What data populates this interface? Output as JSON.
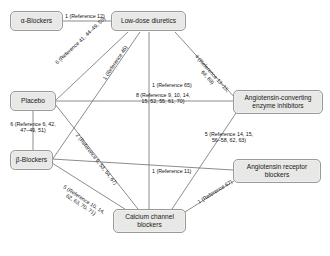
{
  "diagram": {
    "type": "network-meta-analysis",
    "node_fill": "#e8e8e6",
    "node_stroke": "#9a9a98",
    "edge_stroke": "#6f6f6f",
    "background": "#ffffff"
  },
  "nodes": [
    {
      "id": "alpha",
      "label": "α-Blockers"
    },
    {
      "id": "lowdose",
      "label": "Low-dose diuretics"
    },
    {
      "id": "placebo",
      "label": "Placebo"
    },
    {
      "id": "acei",
      "label": "Angiotensin-converting enzyme inhibitors"
    },
    {
      "id": "beta",
      "label": "β-Blockers"
    },
    {
      "id": "arb",
      "label": "Angiotensin receptor blockers"
    },
    {
      "id": "ccb",
      "label": "Calcium channel blockers"
    }
  ],
  "edges": [
    {
      "from": "alpha",
      "to": "lowdose",
      "count": 1,
      "label": "1 (Reference 12)"
    },
    {
      "from": "placebo",
      "to": "lowdose",
      "count": 6,
      "label": "6 (Reference 41, 44–49, 50)"
    },
    {
      "from": "beta",
      "to": "lowdose",
      "count": 1,
      "label": "1 (Reference 46)"
    },
    {
      "from": "ccb",
      "to": "lowdose",
      "count": 1,
      "label": "1 (Reference 65)"
    },
    {
      "from": "acei",
      "to": "lowdose",
      "count": 4,
      "label": "4 (Reference 13–15, 68, 69)"
    },
    {
      "from": "placebo",
      "to": "beta",
      "count": 6,
      "label": "6 (Reference 6, 42, 47–49, 51)"
    },
    {
      "from": "placebo",
      "to": "acei",
      "count": 8,
      "label": "8 (Reference 9, 10, 14, 15, 52, 55, 61, 70)"
    },
    {
      "from": "placebo",
      "to": "ccb",
      "count": 2,
      "label": "2 (Reference 6, 53, 54, 67)"
    },
    {
      "from": "beta",
      "to": "ccb",
      "count": 5,
      "label": "5 (Reference 10, 14, 62, 63, 70, 71)"
    },
    {
      "from": "beta",
      "to": "arb",
      "count": 1,
      "label": "1 (Reference 11)"
    },
    {
      "from": "acei",
      "to": "ccb",
      "count": 5,
      "label": "5 (Reference 14, 15, 56–58, 62, 63)"
    },
    {
      "from": "arb",
      "to": "ccb",
      "count": 1,
      "label": "1 (Reference 67)"
    }
  ],
  "edge_labels": {
    "alpha_lowdose": "1 (Reference 12)",
    "placebo_lowdose": "6 (Reference 41, 44–49, 50)",
    "beta_lowdose": "1 (Reference 46)",
    "ccb_lowdose": "1 (Reference 65)",
    "acei_lowdose_l1": "4 (Reference 13–15,",
    "acei_lowdose_l2": "68, 69)",
    "placebo_beta_l1": "6 (Reference 6, 42,",
    "placebo_beta_l2": "47–49, 51)",
    "placebo_acei_l1": "8 (Reference 9, 10, 14,",
    "placebo_acei_l2": "15, 52, 55, 61, 70)",
    "placebo_ccb": "2 (Reference 6, 53, 54, 67)",
    "beta_ccb_l1": "5 (Reference 10, 14,",
    "beta_ccb_l2": "62, 63, 70, 71)",
    "beta_arb": "1 (Reference 11)",
    "acei_ccb_l1": "5 (Reference 14, 15,",
    "acei_ccb_l2": "56–58, 62, 63)",
    "arb_ccb": "1 (Reference 67)"
  }
}
